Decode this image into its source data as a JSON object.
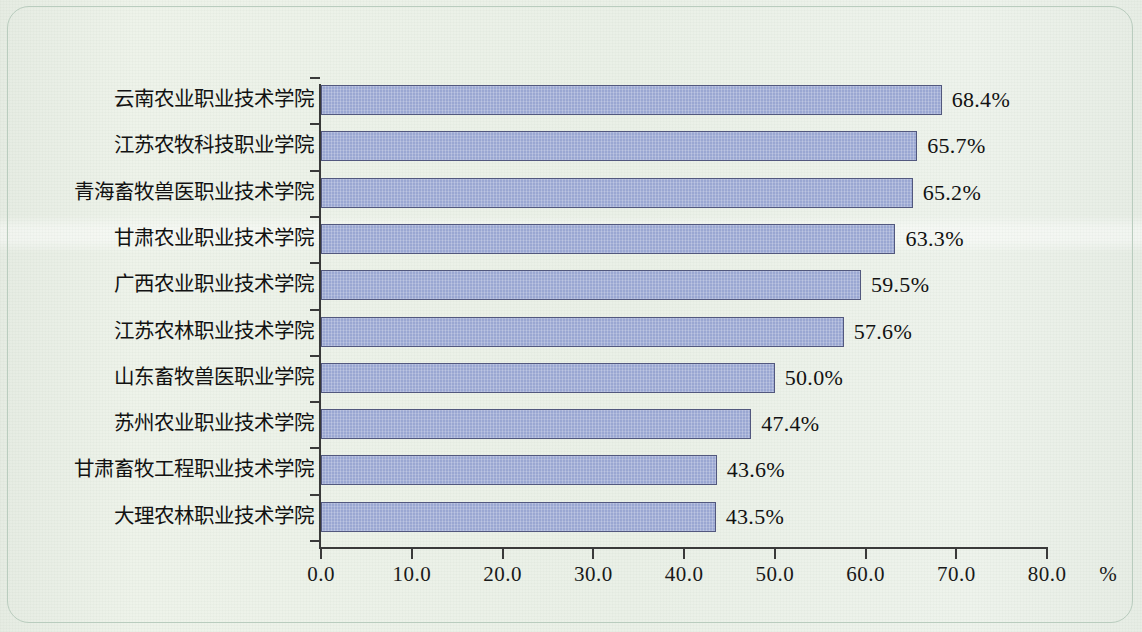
{
  "chart_data": {
    "type": "bar",
    "orientation": "horizontal",
    "title": "",
    "subtitle": "",
    "xlabel": "%",
    "ylabel": "",
    "xlim": [
      0,
      80
    ],
    "xticks": [
      "0.0",
      "10.0",
      "20.0",
      "30.0",
      "40.0",
      "50.0",
      "60.0",
      "70.0",
      "80.0"
    ],
    "x_unit": "%",
    "grid": false,
    "legend": false,
    "bar_color": "#9aa7d2",
    "bar_border_color": "#52587e",
    "background_color": "#eaf0e7",
    "frame_color": "#b9ccbe",
    "text_color": "#121212",
    "categories": [
      "云南农业职业技术学院",
      "江苏农牧科技职业学院",
      "青海畜牧兽医职业技术学院",
      "甘肃农业职业技术学院",
      "广西农业职业技术学院",
      "江苏农林职业技术学院",
      "山东畜牧兽医职业学院",
      "苏州农业职业技术学院",
      "甘肃畜牧工程职业技术学院",
      "大理农林职业技术学院"
    ],
    "values": [
      68.4,
      65.7,
      65.2,
      63.3,
      59.5,
      57.6,
      50.0,
      47.4,
      43.6,
      43.5
    ],
    "value_labels": [
      "68.4%",
      "65.7%",
      "65.2%",
      "63.3%",
      "59.5%",
      "57.6%",
      "50.0%",
      "47.4%",
      "43.6%",
      "43.5%"
    ]
  }
}
